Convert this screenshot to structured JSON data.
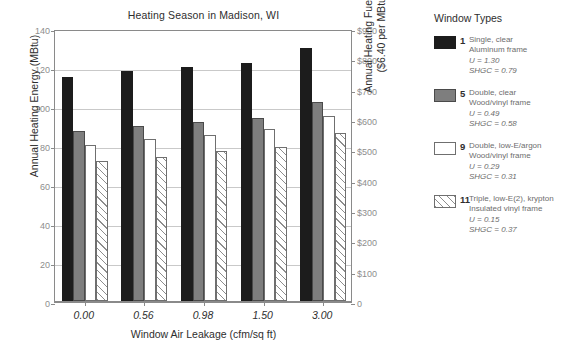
{
  "chart_data": {
    "type": "bar",
    "title": "Heating Season in Madison, WI",
    "xlabel": "Window Air Leakage (cfm/sq ft)",
    "ylabel": "Annual Heating Energy (MBtu)",
    "categories": [
      "0.00",
      "0.56",
      "0.98",
      "1.50",
      "3.00"
    ],
    "ylim": [
      0,
      140
    ],
    "yticks": [
      "0",
      "20",
      "40",
      "60",
      "80",
      "100",
      "120",
      "140"
    ],
    "y2label_line1": "Annual Heating Fuel Cost",
    "y2label_line2": "($6.40 per MBtu)",
    "y2lim": [
      0,
      900
    ],
    "y2ticks": [
      "0",
      "$100",
      "$200",
      "$300",
      "$400",
      "$500",
      "$600",
      "$700",
      "$800",
      "$900"
    ],
    "grid": true,
    "legend_position": "right",
    "series": [
      {
        "name": "1 Single, clear Aluminum frame",
        "swatch": "black",
        "values": [
          115,
          118,
          120,
          122,
          130
        ]
      },
      {
        "name": "5 Double, clear Wood/vinyl frame",
        "swatch": "gray",
        "values": [
          87,
          90,
          92,
          94,
          102
        ]
      },
      {
        "name": "9 Double, low-E/argon Wood/vinyl frame",
        "swatch": "white",
        "values": [
          80,
          83,
          85,
          88,
          95
        ]
      },
      {
        "name": "11 Triple, low-E(2), krypton Insulated vinyl frame",
        "swatch": "hatched",
        "values": [
          72,
          74,
          77,
          79,
          86
        ]
      }
    ]
  },
  "legend": {
    "title": "Window Types",
    "items": [
      {
        "number": "1",
        "line1": "Single, clear",
        "line2": "Aluminum frame",
        "u": "U = 1.30",
        "shgc": "SHGC = 0.79"
      },
      {
        "number": "5",
        "line1": "Double, clear",
        "line2": "Wood/vinyl frame",
        "u": "U = 0.49",
        "shgc": "SHGC = 0.58"
      },
      {
        "number": "9",
        "line1": "Double, low-E/argon",
        "line2": "Wood/vinyl frame",
        "u": "U = 0.29",
        "shgc": "SHGC = 0.31"
      },
      {
        "number": "11",
        "line1": "Triple, low-E(2), krypton",
        "line2": "Insulated vinyl frame",
        "u": "U = 0.15",
        "shgc": "SHGC = 0.37"
      }
    ]
  },
  "colors": {
    "series_black": "#1c1c1c",
    "series_gray": "#7e7e7e",
    "series_white": "#ffffff",
    "series_hatched": "#8d8d8d",
    "axis": "#8a8a8a",
    "grid": "#c9c9c9",
    "tick_text": "#8d8d8d",
    "body_text": "#2e2e2e"
  }
}
